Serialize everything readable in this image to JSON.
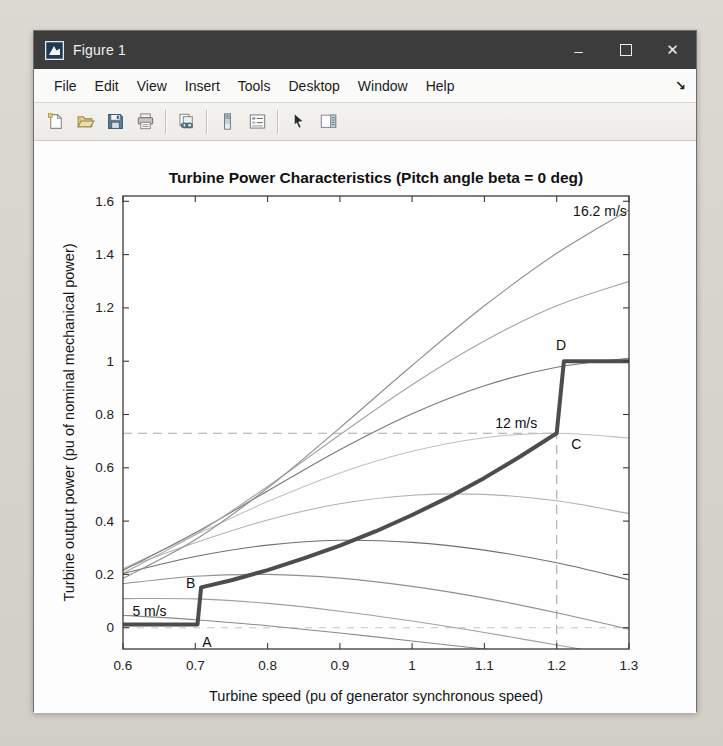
{
  "window": {
    "title": "Figure 1",
    "controls": {
      "minimize_glyph": "–",
      "maximize_icon": "maximize-square",
      "close_glyph": "✕"
    }
  },
  "menubar": {
    "items": [
      "File",
      "Edit",
      "View",
      "Insert",
      "Tools",
      "Desktop",
      "Window",
      "Help"
    ],
    "dock_glyph": "↘"
  },
  "toolbar": {
    "groups": [
      [
        "new-figure",
        "open-file",
        "save-figure",
        "print-figure"
      ],
      [
        "link-plot"
      ],
      [
        "insert-colorbar",
        "insert-legend"
      ],
      [
        "edit-plot",
        "show-plot-tools"
      ]
    ]
  },
  "chart_data": {
    "type": "line",
    "title": "Turbine Power Characteristics (Pitch angle beta = 0 deg)",
    "xlabel": "Turbine speed (pu of generator synchronous speed)",
    "ylabel": "Turbine output power (pu of nominal mechanical power)",
    "xlim": [
      0.6,
      1.3
    ],
    "ylim": [
      -0.08,
      1.62
    ],
    "xticks": [
      0.6,
      0.7,
      0.8,
      0.9,
      1.0,
      1.1,
      1.2,
      1.3
    ],
    "xtick_labels": [
      "0.6",
      "0.7",
      "0.8",
      "0.9",
      "1",
      "1.1",
      "1.2",
      "1.3"
    ],
    "yticks": [
      0,
      0.2,
      0.4,
      0.6,
      0.8,
      1.0,
      1.2,
      1.4,
      1.6
    ],
    "ytick_labels": [
      "0",
      "0.2",
      "0.4",
      "0.6",
      "0.8",
      "1",
      "1.2",
      "1.4",
      "1.6"
    ],
    "grid": false,
    "box": true,
    "x": [
      0.6,
      0.7,
      0.8,
      0.9,
      1.0,
      1.1,
      1.2,
      1.3
    ],
    "wind_speed_curves": [
      {
        "wind_speed": "5 m/s",
        "value": 5,
        "stroke": "#8a8a8a",
        "y": [
          0.047,
          0.03,
          0.007,
          -0.02,
          -0.05,
          -0.08,
          -0.11,
          -0.14
        ]
      },
      {
        "wind_speed": "6.4 m/s",
        "value": 6.4,
        "stroke": "#a0a0a0",
        "y": [
          0.109,
          0.108,
          0.091,
          0.062,
          0.025,
          -0.018,
          -0.065,
          -0.11
        ]
      },
      {
        "wind_speed": "7.8 m/s",
        "value": 7.8,
        "stroke": "#909090",
        "y": [
          0.165,
          0.193,
          0.2,
          0.186,
          0.155,
          0.111,
          0.056,
          -0.006
        ]
      },
      {
        "wind_speed": "9.2 m/s",
        "value": 9.2,
        "stroke": "#6f6f6f",
        "y": [
          0.203,
          0.267,
          0.31,
          0.328,
          0.32,
          0.291,
          0.244,
          0.18
        ]
      },
      {
        "wind_speed": "10.6 m/s",
        "value": 10.6,
        "stroke": "#b0b0b0",
        "y": [
          0.221,
          0.319,
          0.404,
          0.465,
          0.497,
          0.5,
          0.476,
          0.428
        ]
      },
      {
        "wind_speed": "12 m/s",
        "value": 12,
        "stroke": "#c0c0c0",
        "y": [
          0.222,
          0.348,
          0.473,
          0.581,
          0.662,
          0.713,
          0.73,
          0.712
        ]
      },
      {
        "wind_speed": "13.4 m/s",
        "value": 13.4,
        "stroke": "#787878",
        "y": [
          0.215,
          0.356,
          0.513,
          0.668,
          0.803,
          0.908,
          0.977,
          1.011
        ]
      },
      {
        "wind_speed": "14.8 m/s",
        "value": 14.8,
        "stroke": "#a5a5a5",
        "y": [
          0.204,
          0.35,
          0.53,
          0.724,
          0.912,
          1.076,
          1.208,
          1.3
        ]
      },
      {
        "wind_speed": "16.2 m/s",
        "value": 16.2,
        "stroke": "#8e8e8e",
        "y": [
          0.185,
          0.33,
          0.524,
          0.75,
          0.984,
          1.208,
          1.405,
          1.568
        ]
      }
    ],
    "tracking_characteristic": {
      "label_points": [
        "A",
        "B",
        "C",
        "D"
      ],
      "stroke": "#4d4d4d",
      "width": 4,
      "points": [
        [
          0.6,
          0.012
        ],
        [
          0.703,
          0.012
        ],
        [
          0.708,
          0.151
        ],
        [
          0.75,
          0.178
        ],
        [
          0.8,
          0.216
        ],
        [
          0.85,
          0.26
        ],
        [
          0.9,
          0.308
        ],
        [
          0.95,
          0.362
        ],
        [
          1.0,
          0.423
        ],
        [
          1.05,
          0.489
        ],
        [
          1.1,
          0.562
        ],
        [
          1.15,
          0.643
        ],
        [
          1.2,
          0.73
        ],
        [
          1.21,
          1.0
        ],
        [
          1.3,
          1.0
        ]
      ]
    },
    "guide_lines": [
      {
        "from": [
          0.6,
          0.73
        ],
        "to": [
          1.2,
          0.73
        ],
        "stroke": "#a9a9a9",
        "dash": "9 6"
      },
      {
        "from": [
          1.2,
          -0.08
        ],
        "to": [
          1.2,
          0.73
        ],
        "stroke": "#a9a9a9",
        "dash": "9 6"
      },
      {
        "from": [
          0.6,
          0.0
        ],
        "to": [
          1.3,
          0.0
        ],
        "stroke": "#c6c6c6",
        "dash": "7 7"
      }
    ],
    "annotations": [
      {
        "text": "16.2 m/s",
        "x": 1.297,
        "y": 1.563,
        "anchor": "end"
      },
      {
        "text": "12 m/s",
        "x": 1.173,
        "y": 0.768,
        "anchor": "end"
      },
      {
        "text": "5 m/s",
        "x": 0.613,
        "y": 0.062,
        "anchor": "start"
      },
      {
        "text": "A",
        "x": 0.716,
        "y": -0.055,
        "anchor": "middle"
      },
      {
        "text": "B",
        "x": 0.7,
        "y": 0.168,
        "anchor": "end"
      },
      {
        "text": "C",
        "x": 1.22,
        "y": 0.69,
        "anchor": "start"
      },
      {
        "text": "D",
        "x": 1.206,
        "y": 1.062,
        "anchor": "middle"
      }
    ],
    "colors": {
      "axes": "#3a3a3a",
      "tick_text": "#222222",
      "annotation_text": "#111111"
    }
  }
}
